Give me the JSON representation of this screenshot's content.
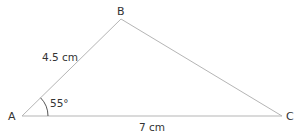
{
  "diagram": {
    "type": "triangle",
    "vertices": [
      {
        "label": "A",
        "x": 22,
        "y": 116
      },
      {
        "label": "B",
        "x": 121,
        "y": 19
      },
      {
        "label": "C",
        "x": 282,
        "y": 116
      }
    ],
    "sides": [
      {
        "name": "AB",
        "label": "4.5 cm"
      },
      {
        "name": "AC",
        "label": "7 cm"
      }
    ],
    "angles": [
      {
        "vertex": "A",
        "label": "55°"
      }
    ],
    "colors": {
      "line": "#b5b5b5",
      "text": "#333333"
    }
  }
}
